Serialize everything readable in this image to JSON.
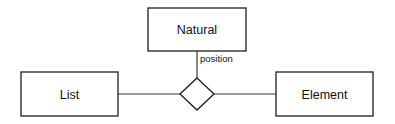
{
  "diagram": {
    "type": "entity-relationship",
    "entities": [
      {
        "id": "natural",
        "label": "Natural"
      },
      {
        "id": "list",
        "label": "List"
      },
      {
        "id": "element",
        "label": "Element"
      }
    ],
    "relationship": {
      "shape": "diamond",
      "label": "",
      "connects": [
        "list",
        "element",
        "natural"
      ]
    },
    "roles": [
      {
        "connector": "natural-to-relationship",
        "label": "position"
      }
    ],
    "colors": {
      "stroke": "#1e1e1e",
      "fill": "#ffffff",
      "text": "#111111"
    }
  }
}
